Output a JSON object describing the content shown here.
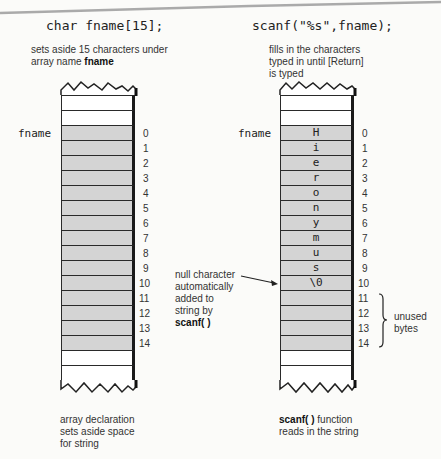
{
  "left": {
    "code": "char fname[15];",
    "caption_top_line1": "sets aside 15 characters under",
    "caption_top_line2_prefix": "array name ",
    "caption_top_line2_bold": "fname",
    "array_label": "fname",
    "indices": [
      "0",
      "1",
      "2",
      "3",
      "4",
      "5",
      "6",
      "7",
      "8",
      "9",
      "10",
      "11",
      "12",
      "13",
      "14"
    ],
    "cells": [
      "",
      "",
      "",
      "",
      "",
      "",
      "",
      "",
      "",
      "",
      "",
      "",
      "",
      "",
      ""
    ],
    "caption_bottom": [
      "array declaration",
      "sets aside space",
      "for string"
    ]
  },
  "right": {
    "code": "scanf(\"%s\",fname);",
    "caption_top": [
      "fills in the characters",
      "typed in until [Return]",
      "is typed"
    ],
    "array_label": "fname",
    "indices": [
      "0",
      "1",
      "2",
      "3",
      "4",
      "5",
      "6",
      "7",
      "8",
      "9",
      "10",
      "11",
      "12",
      "13",
      "14"
    ],
    "cells": [
      "H",
      "i",
      "e",
      "r",
      "o",
      "n",
      "y",
      "m",
      "u",
      "s",
      "\\0",
      "",
      "",
      "",
      ""
    ],
    "unused_label": [
      "unused",
      "bytes"
    ],
    "caption_bottom_bold": "scanf( )",
    "caption_bottom_rest": " function",
    "caption_bottom_line2": "reads in the string"
  },
  "annotation": {
    "null_char": [
      "null character",
      "automatically",
      "added to",
      "string by"
    ],
    "null_char_bold": "scanf( )"
  },
  "colors": {
    "used_cell": "#d4d4d4",
    "empty_cell": "#ffffff",
    "border": "#1a1a1a"
  }
}
